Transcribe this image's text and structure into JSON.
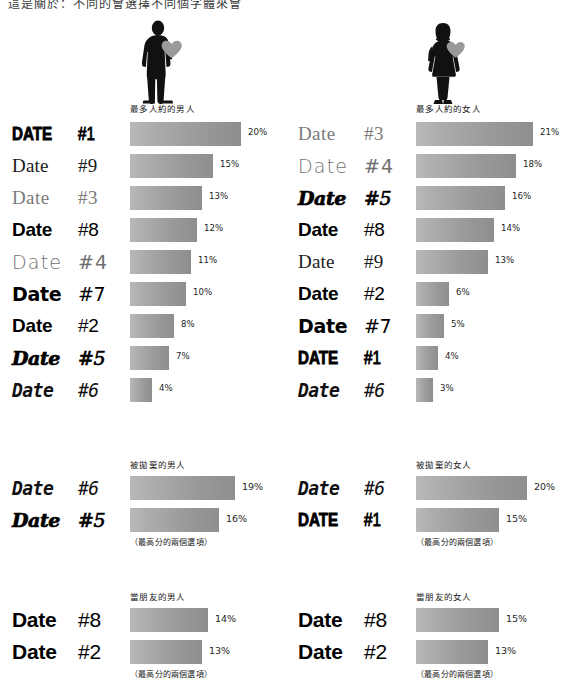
{
  "page": {
    "top_clipped_caption": "這是關於：不同的會選擇不同個字體來會",
    "background": "#ffffff",
    "bar_color_start": "#b9b9b9",
    "bar_color_end": "#8e8e8e",
    "percent_text_color": "#1d1d1d"
  },
  "two_top_note": "（最高分的兩個選項）",
  "sections": [
    {
      "id": "most-dated-men",
      "icon": "male-silhouette-with-heart-icon",
      "title": "最多人約的男人",
      "footnote": "",
      "rows": [
        {
          "word": "DATE",
          "number": "#1",
          "style": "f1",
          "value": 20,
          "label": "20%"
        },
        {
          "word": "Date",
          "number": "#9",
          "style": "f9",
          "value": 15,
          "label": "15%"
        },
        {
          "word": "Date",
          "number": "#3",
          "style": "f3",
          "value": 13,
          "label": "13%"
        },
        {
          "word": "Date",
          "number": "#8",
          "style": "f8",
          "value": 12,
          "label": "12%"
        },
        {
          "word": "Date",
          "number": "#4",
          "style": "f4",
          "value": 11,
          "label": "11%"
        },
        {
          "word": "Date",
          "number": "#7",
          "style": "f7",
          "value": 10,
          "label": "10%"
        },
        {
          "word": "Date",
          "number": "#2",
          "style": "f2",
          "value": 8,
          "label": "8%"
        },
        {
          "word": "Date",
          "number": "#5",
          "style": "f5",
          "value": 7,
          "label": "7%"
        },
        {
          "word": "Date",
          "number": "#6",
          "style": "f6",
          "value": 4,
          "label": "4%"
        }
      ]
    },
    {
      "id": "most-dated-women",
      "icon": "female-silhouette-with-heart-icon",
      "title": "最多人約的女人",
      "footnote": "",
      "rows": [
        {
          "word": "Date",
          "number": "#3",
          "style": "f3",
          "value": 21,
          "label": "21%"
        },
        {
          "word": "Date",
          "number": "#4",
          "style": "f4",
          "value": 18,
          "label": "18%"
        },
        {
          "word": "Date",
          "number": "#5",
          "style": "f5",
          "value": 16,
          "label": "16%"
        },
        {
          "word": "Date",
          "number": "#8",
          "style": "f8",
          "value": 14,
          "label": "14%"
        },
        {
          "word": "Date",
          "number": "#9",
          "style": "f9",
          "value": 13,
          "label": "13%"
        },
        {
          "word": "Date",
          "number": "#2",
          "style": "f2",
          "value": 6,
          "label": "6%"
        },
        {
          "word": "Date",
          "number": "#7",
          "style": "f7",
          "value": 5,
          "label": "5%"
        },
        {
          "word": "DATE",
          "number": "#1",
          "style": "f1",
          "value": 4,
          "label": "4%"
        },
        {
          "word": "Date",
          "number": "#6",
          "style": "f6",
          "value": 3,
          "label": "3%"
        }
      ]
    },
    {
      "id": "dumped-men",
      "icon": "",
      "title": "被拋棄的男人",
      "footnote": "（最高分的兩個選項）",
      "rows": [
        {
          "word": "Date",
          "number": "#6",
          "style": "f6",
          "value": 19,
          "label": "19%"
        },
        {
          "word": "Date",
          "number": "#5",
          "style": "f5",
          "value": 16,
          "label": "16%"
        }
      ]
    },
    {
      "id": "dumped-women",
      "icon": "",
      "title": "被拋棄的女人",
      "footnote": "（最高分的兩個選項）",
      "rows": [
        {
          "word": "Date",
          "number": "#6",
          "style": "f6",
          "value": 20,
          "label": "20%"
        },
        {
          "word": "DATE",
          "number": "#1",
          "style": "f1",
          "value": 15,
          "label": "15%"
        }
      ]
    },
    {
      "id": "friendzone-men",
      "icon": "",
      "title": "當朋友的男人",
      "footnote": "（最高分的兩個選項）",
      "rows": [
        {
          "word": "Date",
          "number": "#8",
          "style": "f8",
          "value": 14,
          "label": "14%"
        },
        {
          "word": "Date",
          "number": "#2",
          "style": "f2",
          "value": 13,
          "label": "13%"
        }
      ]
    },
    {
      "id": "friendzone-women",
      "icon": "",
      "title": "當朋友的女人",
      "footnote": "（最高分的兩個選項）",
      "rows": [
        {
          "word": "Date",
          "number": "#8",
          "style": "f8",
          "value": 15,
          "label": "15%"
        },
        {
          "word": "Date",
          "number": "#2",
          "style": "f2",
          "value": 13,
          "label": "13%"
        }
      ]
    }
  ],
  "chart_data": {
    "type": "bar",
    "xlabel": "",
    "ylabel": "",
    "xlim": [
      0,
      21
    ],
    "grid": false,
    "legend": "none",
    "orientation": "horizontal",
    "units": "percent",
    "panels": [
      {
        "name": "最多人約的男人",
        "categories": [
          "DATE #1",
          "Date #9",
          "Date #3",
          "Date #8",
          "Date #4",
          "Date #7",
          "Date #2",
          "Date #5",
          "Date #6"
        ],
        "values": [
          20,
          15,
          13,
          12,
          11,
          10,
          8,
          7,
          4
        ]
      },
      {
        "name": "最多人約的女人",
        "categories": [
          "Date #3",
          "Date #4",
          "Date #5",
          "Date #8",
          "Date #9",
          "Date #2",
          "Date #7",
          "DATE #1",
          "Date #6"
        ],
        "values": [
          21,
          18,
          16,
          14,
          13,
          6,
          5,
          4,
          3
        ]
      },
      {
        "name": "被拋棄的男人",
        "categories": [
          "Date #6",
          "Date #5"
        ],
        "values": [
          19,
          16
        ]
      },
      {
        "name": "被拋棄的女人",
        "categories": [
          "Date #6",
          "DATE #1"
        ],
        "values": [
          20,
          15
        ]
      },
      {
        "name": "當朋友的男人",
        "categories": [
          "Date #8",
          "Date #2"
        ],
        "values": [
          14,
          13
        ]
      },
      {
        "name": "當朋友的女人",
        "categories": [
          "Date #8",
          "Date #2"
        ],
        "values": [
          15,
          13
        ]
      }
    ]
  }
}
